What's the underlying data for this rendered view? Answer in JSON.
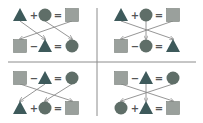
{
  "colors": {
    "triangle": "#3e5a5b",
    "circle": "#5f6e68",
    "square": "#9aa09c",
    "square_stroke": "#7a807c",
    "arrow": "#8a8a8a",
    "divider": "#8c8c8c",
    "operator": "#555555"
  },
  "panels": [
    {
      "id": "top-left",
      "rows": [
        {
          "y": 15,
          "items": [
            "triangle",
            "+",
            "circle",
            "=",
            "square"
          ]
        },
        {
          "y": 46,
          "items": [
            "square",
            "−",
            "triangle",
            "=",
            "circle"
          ]
        }
      ],
      "arrows": [
        [
          0,
          2
        ],
        [
          2,
          4
        ],
        [
          4,
          0
        ]
      ]
    },
    {
      "id": "top-right",
      "rows": [
        {
          "y": 15,
          "items": [
            "triangle",
            "+",
            "circle",
            "=",
            "square"
          ]
        },
        {
          "y": 46,
          "items": [
            "square",
            "−",
            "circle",
            "=",
            "triangle"
          ]
        }
      ],
      "arrows": [
        [
          0,
          4
        ],
        [
          2,
          2
        ],
        [
          4,
          0
        ]
      ]
    },
    {
      "id": "bottom-left",
      "rows": [
        {
          "y": 78,
          "items": [
            "square",
            "−",
            "triangle",
            "=",
            "circle"
          ]
        },
        {
          "y": 108,
          "items": [
            "triangle",
            "+",
            "circle",
            "=",
            "square"
          ]
        }
      ],
      "arrows": [
        [
          0,
          4
        ],
        [
          2,
          0
        ],
        [
          4,
          2
        ]
      ]
    },
    {
      "id": "bottom-right",
      "rows": [
        {
          "y": 78,
          "items": [
            "square",
            "−",
            "triangle",
            "=",
            "circle"
          ]
        },
        {
          "y": 108,
          "items": [
            "circle",
            "+",
            "triangle",
            "=",
            "square"
          ]
        }
      ],
      "arrows": [
        [
          0,
          4
        ],
        [
          2,
          2
        ],
        [
          4,
          0
        ]
      ]
    }
  ]
}
